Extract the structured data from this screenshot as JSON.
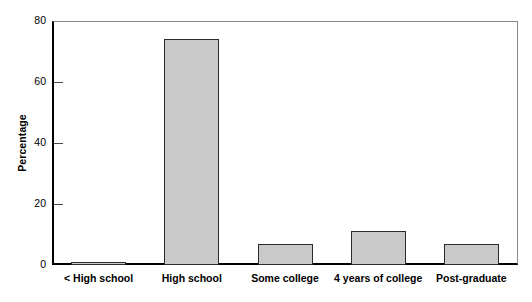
{
  "chart_data": {
    "type": "bar",
    "title": "",
    "subtitle": "",
    "xlabel": "",
    "ylabel": "Percentage",
    "categories": [
      "< High school",
      "High school",
      "Some college",
      "4 years of college",
      "Post-graduate"
    ],
    "values": [
      0.5,
      74,
      7,
      11,
      7
    ],
    "ylim": [
      0,
      80
    ],
    "yticks": [
      0,
      20,
      40,
      60,
      80
    ],
    "ytick_labels": [
      "0",
      "20",
      "40",
      "60",
      "80"
    ],
    "grid": false,
    "legend": null,
    "legend_position": "none",
    "series": [
      {
        "name": "Percentage",
        "values": [
          0.5,
          74,
          7,
          11,
          7
        ]
      }
    ],
    "annotations": []
  },
  "style": {
    "bar_fill": "#c9c9c9",
    "bar_border": "#2b2b2b",
    "axis_color": "#000000",
    "frame_color": "#8a8a8a",
    "tick_color": "#4a4a4a",
    "background": "#ffffff"
  }
}
